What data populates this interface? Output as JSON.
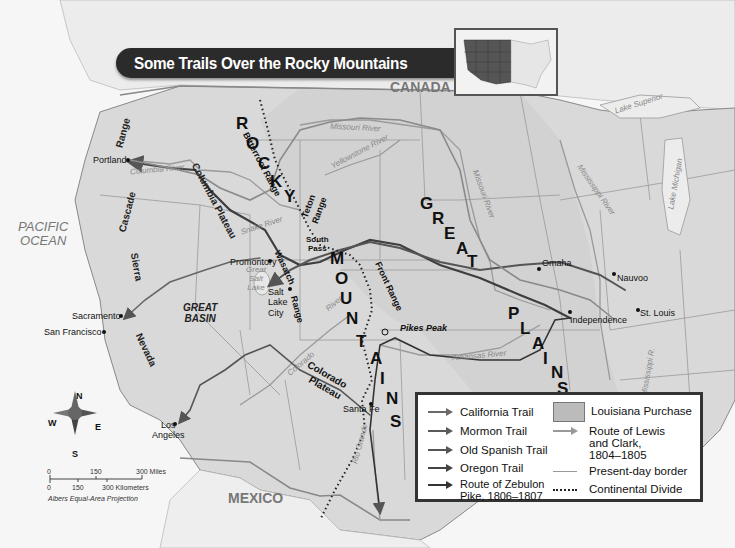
{
  "title": "Some Trails Over the Rocky Mountains",
  "countries": {
    "canada": "CANADA",
    "mexico": "MEXICO"
  },
  "ocean": {
    "line1": "PACIFIC",
    "line2": "OCEAN"
  },
  "ranges": {
    "cascade": "Cascade",
    "range_word": "Range",
    "sierra": "Sierra",
    "nevada": "Nevada",
    "bitterroot": "Bitterroot Range",
    "teton_1": "Teton",
    "teton_2": "Range",
    "wasatch": "Wasatch",
    "wasatch_range": "Range",
    "front": "Front Range"
  },
  "big_labels": {
    "rocky": [
      "R",
      "O",
      "C",
      "K",
      "Y"
    ],
    "mountains": [
      "M",
      "O",
      "U",
      "N",
      "T",
      "A",
      "I",
      "N",
      "S"
    ],
    "great": [
      "G",
      "R",
      "E",
      "A",
      "T"
    ],
    "plains": [
      "P",
      "L",
      "A",
      "I",
      "N",
      "S"
    ]
  },
  "regions": {
    "columbia_plateau": "Columbia Plateau",
    "great_basin_1": "GREAT",
    "great_basin_2": "BASIN",
    "colorado_plateau_1": "Colorado",
    "colorado_plateau_2": "Plateau",
    "south_pass_1": "South",
    "south_pass_2": "Pass",
    "great_salt_lake_1": "Great",
    "great_salt_lake_2": "Salt",
    "great_salt_lake_3": "Lake"
  },
  "cities": {
    "portland": "Portland",
    "sacramento": "Sacramento",
    "san_francisco": "San Francisco",
    "los_angeles_1": "Los",
    "los_angeles_2": "Angeles",
    "promontory": "Promontory",
    "salt_lake_1": "Salt",
    "salt_lake_2": "Lake",
    "salt_lake_3": "City",
    "santa_fe": "Santa Fe",
    "pikes_peak": "Pikes Peak",
    "omaha": "Omaha",
    "nauvoo": "Nauvoo",
    "independence": "Independence",
    "st_louis": "St. Louis"
  },
  "rivers": {
    "columbia": "Columbia River",
    "snake": "Snake River",
    "missouri_north": "Missouri River",
    "yellowstone": "Yellowstone River",
    "missouri_east": "Missouri River",
    "mississippi": "Mississippi River",
    "mississippi_r": "Mississippi R.",
    "arkansas": "Arkansas River",
    "colorado": "Colorado",
    "river": "River",
    "rio_grande": "Rio Grande"
  },
  "lakes": {
    "superior": "Lake Superior",
    "michigan": "Lake Michigan"
  },
  "compass": {
    "n": "N",
    "s": "S",
    "e": "E",
    "w": "W"
  },
  "scale": {
    "miles": [
      "0",
      "150",
      "300 Miles"
    ],
    "km": [
      "0",
      "150",
      "300 Kilometers"
    ],
    "projection": "Albers Equal-Area Projection"
  },
  "legend": {
    "items": [
      {
        "label": "California Trail",
        "color": "#6a6a6a"
      },
      {
        "label": "Mormon Trail",
        "color": "#5a5a5a"
      },
      {
        "label": "Old Spanish Trail",
        "color": "#555555"
      },
      {
        "label": "Oregon Trail",
        "color": "#444444"
      },
      {
        "label": "Route of Zebulon Pike, 1806–1807",
        "color": "#333333"
      }
    ],
    "louisiana": "Louisiana Purchase",
    "lewis_clark": "Route of Lewis and Clark, 1804–1805",
    "border": "Present-day border",
    "divide": "Continental Divide"
  }
}
